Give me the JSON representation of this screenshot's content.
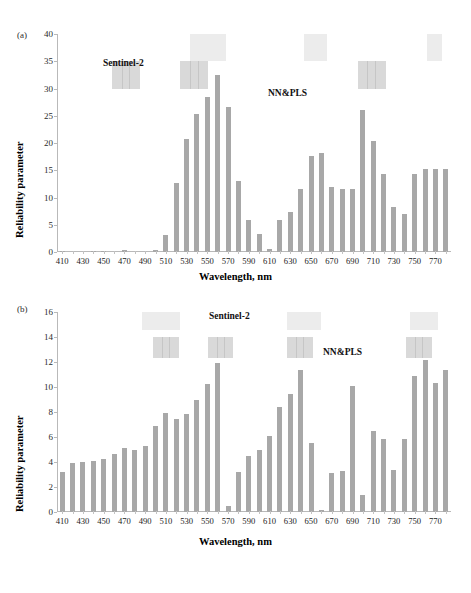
{
  "figure": {
    "panels": [
      {
        "tag": "(a)",
        "annotations": [
          {
            "text": "Sentinel-2",
            "x": 103,
            "y": 40
          },
          {
            "text": "NN&PLS",
            "x": 268,
            "y": 70
          }
        ]
      },
      {
        "tag": "(b)",
        "annotations": [
          {
            "text": "Sentinel-2",
            "x": 209,
            "y": 11
          },
          {
            "text": "NN&PLS",
            "x": 323,
            "y": 47
          }
        ]
      }
    ]
  },
  "chart_data": [
    {
      "type": "bar",
      "panel": "(a)",
      "title": "",
      "xlabel": "Wavelength, nm",
      "ylabel": "Reliability parameter",
      "ylim": [
        0,
        40
      ],
      "ytick_step": 5,
      "yticks": [
        0,
        5,
        10,
        15,
        20,
        25,
        30,
        35,
        40
      ],
      "xlim": [
        405,
        785
      ],
      "xticks": [
        410,
        430,
        450,
        470,
        490,
        510,
        530,
        550,
        570,
        590,
        610,
        630,
        650,
        670,
        690,
        710,
        730,
        750,
        770
      ],
      "grid": false,
      "bar_color": "#a8a8a8",
      "x": [
        410,
        420,
        430,
        440,
        450,
        460,
        470,
        480,
        490,
        500,
        510,
        520,
        530,
        540,
        550,
        560,
        570,
        580,
        590,
        600,
        610,
        620,
        630,
        640,
        650,
        660,
        670,
        680,
        690,
        700,
        710,
        720,
        730,
        740,
        750,
        760,
        770,
        780
      ],
      "values": [
        0.2,
        0.0,
        0.0,
        0.2,
        0.2,
        0.0,
        0.3,
        0.0,
        0.0,
        0.3,
        3.2,
        12.6,
        20.8,
        25.4,
        28.4,
        32.5,
        26.7,
        13.1,
        5.9,
        3.3,
        0.6,
        5.8,
        7.3,
        11.5,
        17.7,
        18.2,
        11.9,
        11.5,
        11.5,
        26.1,
        20.3,
        14.3,
        8.3,
        6.9,
        14.4,
        15.2,
        15.2,
        15.3
      ],
      "annotation_bands": [
        {
          "label": "Sentinel-2 band",
          "start": 458,
          "end": 485,
          "y_top": 35,
          "y_bottom": 30,
          "shade": "solid"
        },
        {
          "label": "Sentinel-2 band",
          "start": 524,
          "end": 551,
          "y_top": 35,
          "y_bottom": 30,
          "shade": "solid"
        },
        {
          "label": "Sentinel-2 band",
          "start": 695,
          "end": 722,
          "y_top": 35,
          "y_bottom": 30,
          "shade": "solid"
        },
        {
          "label": "NN&PLS band",
          "start": 533,
          "end": 568,
          "y_top": 40,
          "y_bottom": 35,
          "shade": "faint"
        },
        {
          "label": "NN&PLS band",
          "start": 643,
          "end": 665,
          "y_top": 40,
          "y_bottom": 35,
          "shade": "faint"
        },
        {
          "label": "NN&PLS band",
          "start": 762,
          "end": 776,
          "y_top": 40,
          "y_bottom": 35,
          "shade": "faint"
        }
      ]
    },
    {
      "type": "bar",
      "panel": "(b)",
      "title": "",
      "xlabel": "Wavelength, nm",
      "ylabel": "Reliability parameter",
      "ylim": [
        0,
        16
      ],
      "ytick_step": 2,
      "yticks": [
        0,
        2,
        4,
        6,
        8,
        10,
        12,
        14,
        16
      ],
      "xlim": [
        405,
        785
      ],
      "xticks": [
        410,
        430,
        450,
        470,
        490,
        510,
        530,
        550,
        570,
        590,
        610,
        630,
        650,
        670,
        690,
        710,
        730,
        750,
        770
      ],
      "grid": false,
      "bar_color": "#a8a8a8",
      "x": [
        410,
        420,
        430,
        440,
        450,
        460,
        470,
        480,
        490,
        500,
        510,
        520,
        530,
        540,
        550,
        560,
        570,
        580,
        590,
        600,
        610,
        620,
        630,
        640,
        650,
        660,
        670,
        680,
        690,
        700,
        710,
        720,
        730,
        740,
        750,
        760,
        770,
        780
      ],
      "values": [
        3.2,
        3.9,
        4.0,
        4.05,
        4.25,
        4.65,
        5.15,
        5.0,
        5.25,
        6.9,
        7.9,
        7.45,
        7.85,
        8.95,
        10.25,
        11.95,
        0.5,
        3.2,
        4.5,
        4.95,
        6.1,
        8.4,
        9.45,
        11.4,
        5.5,
        0.15,
        3.1,
        3.3,
        10.1,
        1.4,
        6.5,
        5.85,
        3.4,
        5.85,
        10.9,
        12.15,
        10.35,
        11.4
      ],
      "annotation_bands": [
        {
          "label": "Sentinel-2 band",
          "start": 498,
          "end": 523,
          "y_top": 14,
          "y_bottom": 12.3,
          "shade": "solid"
        },
        {
          "label": "Sentinel-2 band",
          "start": 551,
          "end": 575,
          "y_top": 14,
          "y_bottom": 12.3,
          "shade": "solid"
        },
        {
          "label": "Sentinel-2 band",
          "start": 627,
          "end": 652,
          "y_top": 14,
          "y_bottom": 12.3,
          "shade": "solid"
        },
        {
          "label": "Sentinel-2 band",
          "start": 742,
          "end": 767,
          "y_top": 14,
          "y_bottom": 12.3,
          "shade": "solid"
        },
        {
          "label": "NN&PLS band",
          "start": 487,
          "end": 524,
          "y_top": 16,
          "y_bottom": 14.6,
          "shade": "faint"
        },
        {
          "label": "NN&PLS band",
          "start": 627,
          "end": 660,
          "y_top": 16,
          "y_bottom": 14.6,
          "shade": "faint"
        },
        {
          "label": "NN&PLS band",
          "start": 745,
          "end": 772,
          "y_top": 16,
          "y_bottom": 14.6,
          "shade": "faint"
        }
      ]
    }
  ]
}
